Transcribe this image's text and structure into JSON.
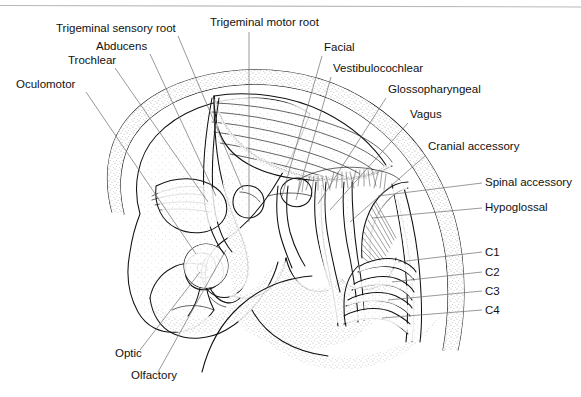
{
  "figure": {
    "style": "black-and-white stippled line drawing",
    "top_rule_color": "#b9b9bd",
    "ink_color": "#111111",
    "leader_color": "#6d6d6d",
    "background": "#ffffff"
  },
  "labels": {
    "left": [
      {
        "id": "trigeminal-sensory-root",
        "text": "Trigeminal sensory root",
        "x": 56,
        "y": 32
      },
      {
        "id": "abducens",
        "text": "Abducens",
        "x": 96,
        "y": 50
      },
      {
        "id": "trochlear",
        "text": "Trochlear",
        "x": 68,
        "y": 64
      },
      {
        "id": "oculomotor",
        "text": "Oculomotor",
        "x": 16,
        "y": 88
      }
    ],
    "top": [
      {
        "id": "trigeminal-motor-root",
        "text": "Trigeminal motor root",
        "x": 210,
        "y": 26
      }
    ],
    "right": [
      {
        "id": "facial",
        "text": "Facial",
        "x": 324,
        "y": 51
      },
      {
        "id": "vestibulocochlear",
        "text": "Vestibulocochlear",
        "x": 333,
        "y": 72
      },
      {
        "id": "glossopharyngeal",
        "text": "Glossopharyngeal",
        "x": 388,
        "y": 93
      },
      {
        "id": "vagus",
        "text": "Vagus",
        "x": 410,
        "y": 118
      },
      {
        "id": "cranial-accessory",
        "text": "Cranial accessory",
        "x": 428,
        "y": 150
      },
      {
        "id": "spinal-accessory",
        "text": "Spinal accessory",
        "x": 485,
        "y": 186
      },
      {
        "id": "hypoglossal",
        "text": "Hypoglossal",
        "x": 485,
        "y": 211
      }
    ],
    "cervical": [
      {
        "id": "c1",
        "text": "C1",
        "x": 485,
        "y": 256
      },
      {
        "id": "c2",
        "text": "C2",
        "x": 485,
        "y": 276
      },
      {
        "id": "c3",
        "text": "C3",
        "x": 485,
        "y": 295
      },
      {
        "id": "c4",
        "text": "C4",
        "x": 485,
        "y": 314
      }
    ],
    "bottom": [
      {
        "id": "optic",
        "text": "Optic",
        "x": 115,
        "y": 357
      },
      {
        "id": "olfactory",
        "text": "Olfactory",
        "x": 131,
        "y": 379
      }
    ]
  }
}
